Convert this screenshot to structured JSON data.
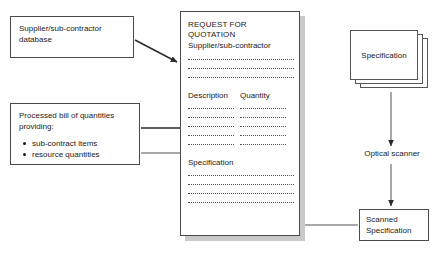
{
  "diagram": {
    "background_color": "#ffffff",
    "line_color": "#4a4a4a",
    "text_color": "#1a1a1a",
    "shadow_color": "#c9c9c9"
  },
  "sources": {
    "supplier_database": {
      "label": "Supplier/sub-contractor\ndatabase"
    },
    "processed_bill": {
      "label": "Processed bill of quantities\nproviding:",
      "items": [
        "sub-contract items",
        "resource quantities"
      ]
    }
  },
  "rfq_document": {
    "title": "REQUEST FOR QUOTATION",
    "subtitle": "Supplier/sub-contractor",
    "supplier_line_count": 3,
    "columns": [
      {
        "header": "Description",
        "line_count": 5
      },
      {
        "header": "Quantity",
        "line_count": 5
      }
    ],
    "specification_header": "Specification",
    "specification_line_count": 4
  },
  "scanning": {
    "specification_stack": {
      "label": "Specification",
      "card_count": 3
    },
    "optical_scanner": {
      "label": "Optical scanner"
    },
    "scanned_specification": {
      "label": "Scanned\nSpecification"
    }
  },
  "connectors": [
    {
      "name": "supplier-db-to-rfq",
      "from": "supplier_database",
      "to": "rfq_document"
    },
    {
      "name": "bill-to-description",
      "from": "processed_bill",
      "to": "description_column"
    },
    {
      "name": "bill-to-quantity",
      "from": "processed_bill",
      "to": "quantity_column"
    },
    {
      "name": "spec-stack-to-scanner",
      "from": "specification_stack",
      "to": "optical_scanner"
    },
    {
      "name": "scanner-to-scanned-spec",
      "from": "optical_scanner",
      "to": "scanned_specification"
    },
    {
      "name": "scanned-spec-to-rfq",
      "from": "scanned_specification",
      "to": "rfq_specification_section"
    }
  ]
}
